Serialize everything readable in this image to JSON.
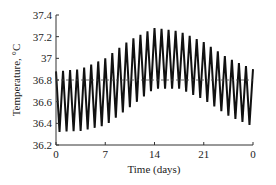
{
  "chart_data": {
    "type": "line",
    "title": "",
    "xlabel": "Time (days)",
    "ylabel": "Temperature, °C",
    "xlim": [
      0,
      28
    ],
    "ylim": [
      36.2,
      37.4
    ],
    "x_ticks": [
      0,
      7,
      14,
      21,
      28
    ],
    "x_tick_labels": [
      "0",
      "7",
      "14",
      "21",
      "0"
    ],
    "y_ticks": [
      36.2,
      36.4,
      36.6,
      36.8,
      37.0,
      37.2,
      37.4
    ],
    "y_tick_labels": [
      "36.2",
      "36.4",
      "36.6",
      "36.8",
      "37",
      "37.2",
      "37.4"
    ],
    "grid": false,
    "legend": null,
    "series": [
      {
        "name": "Body temperature (daily oscillation)",
        "style": "solid black zigzag",
        "cycles": 28,
        "envelope": {
          "x": [
            0,
            3.5,
            7,
            10.5,
            14,
            17.5,
            21,
            24.5,
            28
          ],
          "upper": [
            36.88,
            36.9,
            37.0,
            37.17,
            37.28,
            37.25,
            37.15,
            37.0,
            36.9
          ],
          "lower": [
            36.32,
            36.33,
            36.38,
            36.55,
            36.72,
            36.72,
            36.62,
            36.47,
            36.37
          ]
        }
      },
      {
        "name": "Mean temperature",
        "style": "dashed reference line",
        "x": [
          0,
          28
        ],
        "values": [
          36.8,
          36.8
        ]
      }
    ]
  }
}
